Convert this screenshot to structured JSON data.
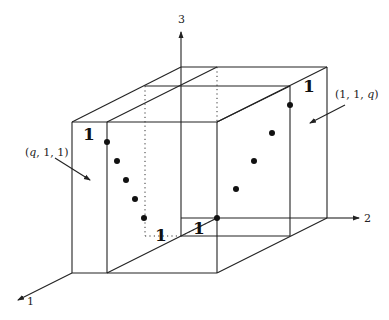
{
  "diagram": {
    "axes": {
      "axis_1_label": "1",
      "axis_2_label": "2",
      "axis_3_label": "3"
    },
    "corner_labels": {
      "front_left_top": "1",
      "back_right_top": "1",
      "bottom_front": "1",
      "bottom_back": "1"
    },
    "annotations": {
      "left_pointer": {
        "open": "(",
        "q": "q",
        "rest": ", 1, 1)"
      },
      "right_pointer": {
        "open": "(1, 1, ",
        "q": "q",
        "close": ")"
      }
    },
    "left_points_count": 5,
    "right_points_count": 5
  }
}
